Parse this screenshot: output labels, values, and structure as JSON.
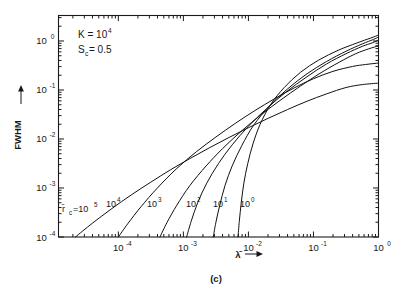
{
  "figure": {
    "caption": "(c)",
    "background_color": "#ffffff",
    "line_color": "#111111"
  },
  "annotations": {
    "k_label": "K = 10",
    "k_exponent": "4",
    "sc_label_base": "S",
    "sc_label_sub": "c",
    "sc_label_value": " = 0.5"
  },
  "axes": {
    "x": {
      "title_base": "λ̄",
      "title_arrow": "→",
      "tick_labels": [
        "10",
        "10",
        "10",
        "10",
        "10"
      ],
      "tick_exponents": [
        "-4",
        "-3",
        "-2",
        "-1",
        "0"
      ],
      "tick_values": [
        -4,
        -3,
        -2,
        -1,
        0
      ],
      "min": -4.92,
      "max": 0
    },
    "y": {
      "title": "FWHM",
      "title_arrow": "→",
      "tick_labels": [
        "10",
        "10",
        "10",
        "10",
        "10"
      ],
      "tick_exponents": [
        "0",
        "-1",
        "-2",
        "-3",
        "-4"
      ],
      "tick_values": [
        0,
        -1,
        -2,
        -3,
        -4
      ],
      "min": -4,
      "max": 0.52
    }
  },
  "curve_labels": {
    "prefix_base": "r̄",
    "prefix_sub": "c",
    "prefix_eq": "=10",
    "prefix_exp": "5",
    "others": [
      {
        "base": "10",
        "exp": "4"
      },
      {
        "base": "10",
        "exp": "3"
      },
      {
        "base": "10",
        "exp": "2"
      },
      {
        "base": "10",
        "exp": "1"
      },
      {
        "base": "10",
        "exp": "0"
      }
    ]
  },
  "chart_data": {
    "type": "line",
    "title": "",
    "subtitle": "",
    "xlabel": "λ̄",
    "ylabel": "FWHM",
    "xscale": "log",
    "yscale": "log",
    "xlim": [
      -4.92,
      0
    ],
    "ylim": [
      -4,
      0.52
    ],
    "grid": false,
    "legend": "inline-curve-labels",
    "legend_position": "inside-bottom-left",
    "annotations": [
      "K = 10^4",
      "S_c = 0.5",
      "(c)"
    ],
    "note": "x and y values are base-10 logarithms of lambda-bar and FWHM respectively",
    "series": [
      {
        "name": "r̄_c = 10^5",
        "label_exponent": 5,
        "x": [
          -4.66,
          -4.4,
          -4.1,
          -3.8,
          -3.5,
          -3.2,
          -2.9,
          -2.6,
          -2.3,
          -2.0,
          -1.7,
          -1.4,
          -1.1,
          -0.8,
          -0.5,
          -0.25,
          0.0
        ],
        "y": [
          -4.0,
          -3.72,
          -3.42,
          -3.14,
          -2.88,
          -2.63,
          -2.4,
          -2.18,
          -1.97,
          -1.77,
          -1.58,
          -1.4,
          -1.23,
          -1.08,
          -0.95,
          -0.89,
          -0.86
        ]
      },
      {
        "name": "r̄_c = 10^4",
        "label_exponent": 4,
        "x": [
          -4.0,
          -3.85,
          -3.65,
          -3.4,
          -3.1,
          -2.8,
          -2.5,
          -2.2,
          -1.9,
          -1.6,
          -1.3,
          -1.0,
          -0.7,
          -0.4,
          -0.2,
          0.0
        ],
        "y": [
          -4.0,
          -3.72,
          -3.38,
          -3.0,
          -2.6,
          -2.26,
          -1.96,
          -1.68,
          -1.42,
          -1.18,
          -0.96,
          -0.77,
          -0.62,
          -0.52,
          -0.48,
          -0.45
        ]
      },
      {
        "name": "r̄_c = 10^3",
        "label_exponent": 3,
        "x": [
          -3.36,
          -3.25,
          -3.1,
          -2.9,
          -2.65,
          -2.4,
          -2.1,
          -1.8,
          -1.5,
          -1.2,
          -0.9,
          -0.6,
          -0.35,
          -0.15,
          0.0
        ],
        "y": [
          -4.0,
          -3.7,
          -3.35,
          -2.95,
          -2.55,
          -2.2,
          -1.83,
          -1.5,
          -1.2,
          -0.92,
          -0.66,
          -0.43,
          -0.26,
          -0.16,
          -0.1
        ]
      },
      {
        "name": "r̄_c = 10^2",
        "label_exponent": 2,
        "x": [
          -2.95,
          -2.88,
          -2.78,
          -2.64,
          -2.46,
          -2.25,
          -2.0,
          -1.72,
          -1.42,
          -1.1,
          -0.8,
          -0.5,
          -0.25,
          -0.1,
          0.0
        ],
        "y": [
          -4.0,
          -3.68,
          -3.3,
          -2.9,
          -2.5,
          -2.12,
          -1.74,
          -1.38,
          -1.04,
          -0.73,
          -0.47,
          -0.26,
          -0.11,
          -0.04,
          0.02
        ]
      },
      {
        "name": "r̄_c = 10^1",
        "label_exponent": 1,
        "x": [
          -2.54,
          -2.5,
          -2.44,
          -2.36,
          -2.25,
          -2.1,
          -1.92,
          -1.68,
          -1.4,
          -1.1,
          -0.8,
          -0.5,
          -0.25,
          -0.08,
          0.0
        ],
        "y": [
          -4.0,
          -3.7,
          -3.35,
          -2.95,
          -2.55,
          -2.13,
          -1.72,
          -1.33,
          -0.98,
          -0.67,
          -0.42,
          -0.21,
          -0.06,
          0.03,
          0.08
        ]
      },
      {
        "name": "r̄_c = 10^0",
        "label_exponent": 0,
        "x": [
          -2.16,
          -2.14,
          -2.11,
          -2.07,
          -2.01,
          -1.93,
          -1.82,
          -1.66,
          -1.45,
          -1.2,
          -0.92,
          -0.62,
          -0.33,
          -0.12,
          0.0
        ],
        "y": [
          -4.0,
          -3.68,
          -3.3,
          -2.9,
          -2.5,
          -2.1,
          -1.7,
          -1.3,
          -0.95,
          -0.64,
          -0.39,
          -0.19,
          -0.04,
          0.06,
          0.12
        ]
      }
    ]
  }
}
